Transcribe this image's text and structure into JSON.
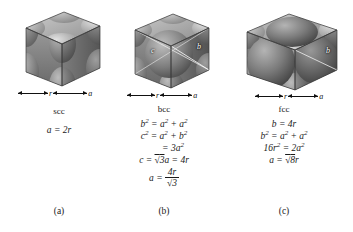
{
  "figure": {
    "background_color": "#ffffff",
    "text_color": "#1a1a1a"
  },
  "panels": [
    {
      "id": "scc",
      "name": "scc",
      "letter": "(a)",
      "icon": "simple-cubic-cell-diagram",
      "dimensions": [
        {
          "label": "r"
        },
        {
          "label": "a"
        }
      ],
      "diagonals": [],
      "equations": [
        "a = 2r"
      ]
    },
    {
      "id": "bcc",
      "name": "bcc",
      "letter": "(b)",
      "icon": "body-centered-cubic-cell-diagram",
      "dimensions": [
        {
          "label": "r"
        },
        {
          "label": "a"
        }
      ],
      "diagonals": [
        {
          "label": "c"
        },
        {
          "label": "b"
        }
      ],
      "equations": [
        "b² = a² + a²",
        "c² = a² + b²",
        "= 3a²",
        "c = √3a = 4r",
        "a = 4r/√3"
      ],
      "fraction": {
        "lead": "a =",
        "numerator": "4r",
        "denominator": "√3"
      }
    },
    {
      "id": "fcc",
      "name": "fcc",
      "letter": "(c)",
      "icon": "face-centered-cubic-cell-diagram",
      "dimensions": [
        {
          "label": "r"
        },
        {
          "label": "a"
        }
      ],
      "diagonals": [
        {
          "label": "b"
        }
      ],
      "equations": [
        "b = 4r",
        "b² = a² + a²",
        "16r² = 2a²",
        "a = √8r"
      ]
    }
  ],
  "equation_parts": {
    "scc": {
      "line1": {
        "lhs": "a",
        "eq": "=",
        "rhs": "2r"
      }
    },
    "bcc": {
      "line1": {
        "lhs": "b",
        "lhs_sup": "2",
        "eq": "=",
        "t1": "a",
        "t1_sup": "2",
        "plus": "+",
        "t2": "a",
        "t2_sup": "2"
      },
      "line2": {
        "lhs": "c",
        "lhs_sup": "2",
        "eq": "=",
        "t1": "a",
        "t1_sup": "2",
        "plus": "+",
        "t2": "b",
        "t2_sup": "2"
      },
      "line3": {
        "eq": "=",
        "rhs": "3a",
        "rhs_sup": "2"
      },
      "line4": {
        "lhs": "c",
        "eq": "=",
        "rad": "√",
        "radicand": "3",
        "after": "a",
        "eq2": "=",
        "rhs": "4r"
      },
      "line5": {
        "lhs": "a",
        "eq": "=",
        "num": "4r",
        "den_rad": "√",
        "den": "3"
      }
    },
    "fcc": {
      "line1": {
        "lhs": "b",
        "eq": "=",
        "rhs": "4r"
      },
      "line2": {
        "lhs": "b",
        "lhs_sup": "2",
        "eq": "=",
        "t1": "a",
        "t1_sup": "2",
        "plus": "+",
        "t2": "a",
        "t2_sup": "2"
      },
      "line3": {
        "lhs": "16r",
        "lhs_sup": "2",
        "eq": "=",
        "rhs": "2a",
        "rhs_sup": "2"
      },
      "line4": {
        "lhs": "a",
        "eq": "=",
        "rad": "√",
        "radicand": "8",
        "after": "r"
      }
    }
  }
}
